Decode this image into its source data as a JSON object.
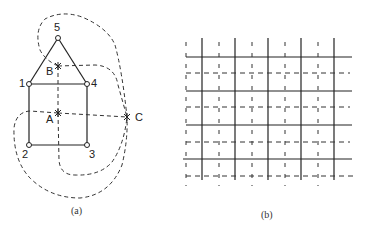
{
  "figure_a": {
    "caption": "(a)",
    "vertices": [
      {
        "id": "5",
        "label": "5"
      },
      {
        "id": "1",
        "label": "1"
      },
      {
        "id": "4",
        "label": "4"
      },
      {
        "id": "2",
        "label": "2"
      },
      {
        "id": "3",
        "label": "3"
      }
    ],
    "dual_points": [
      {
        "id": "A",
        "label": "A"
      },
      {
        "id": "B",
        "label": "B"
      },
      {
        "id": "C",
        "label": "C"
      }
    ]
  },
  "figure_b": {
    "caption": "(b)"
  },
  "colors": {
    "line": "#222222",
    "dash": "#333333"
  }
}
